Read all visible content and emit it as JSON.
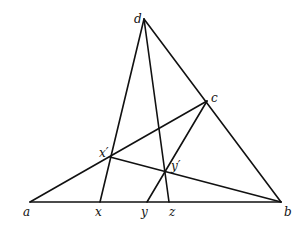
{
  "diagram": {
    "type": "geometric-construction",
    "colors": {
      "line": "#111111",
      "background": "#ffffff"
    },
    "points": [
      {
        "id": "a",
        "label": "a",
        "x": 30,
        "y": 202,
        "lx": 23,
        "ly": 216
      },
      {
        "id": "b",
        "label": "b",
        "x": 281,
        "y": 202,
        "lx": 284,
        "ly": 216
      },
      {
        "id": "c",
        "label": "c",
        "x": 207,
        "y": 101,
        "lx": 211,
        "ly": 102
      },
      {
        "id": "d",
        "label": "d",
        "x": 144,
        "y": 19,
        "lx": 134,
        "ly": 23
      },
      {
        "id": "x",
        "label": "x",
        "x": 100,
        "y": 202,
        "lx": 95,
        "ly": 216
      },
      {
        "id": "y",
        "label": "y",
        "x": 147,
        "y": 202,
        "lx": 141,
        "ly": 216
      },
      {
        "id": "z",
        "label": "z",
        "x": 169,
        "y": 202,
        "lx": 169,
        "ly": 216
      },
      {
        "id": "xp",
        "label": "x′",
        "x": 110,
        "y": 157,
        "lx": 99,
        "ly": 157
      },
      {
        "id": "yp",
        "label": "y′",
        "x": 164,
        "y": 172,
        "lx": 171,
        "ly": 170
      }
    ],
    "segments": [
      {
        "from": "a",
        "to": "b"
      },
      {
        "from": "d",
        "to": "b"
      },
      {
        "from": "a",
        "to": "c"
      },
      {
        "from": "d",
        "to": "x"
      },
      {
        "from": "d",
        "to": "z"
      },
      {
        "from": "xp",
        "to": "b"
      },
      {
        "from": "c",
        "to": "y"
      }
    ]
  }
}
